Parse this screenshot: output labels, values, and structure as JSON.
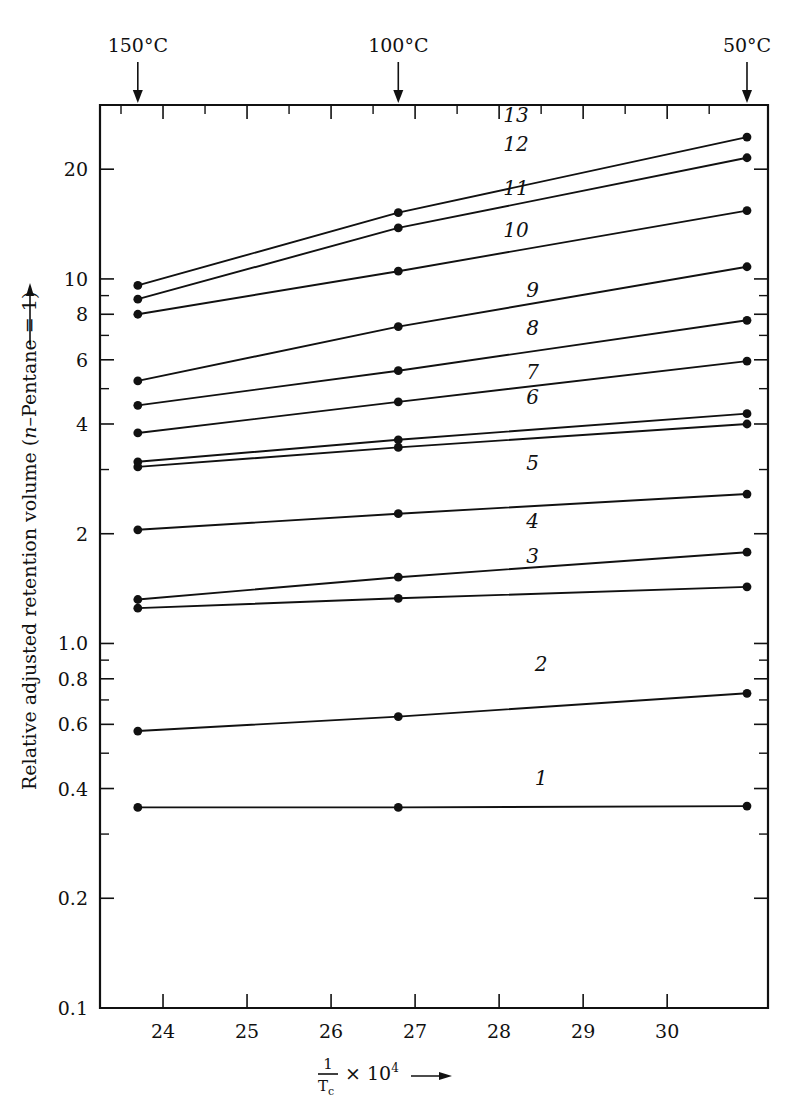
{
  "chart_data": {
    "type": "line",
    "title": "",
    "xlabel": "1/Tc × 10⁴ ⟶",
    "ylabel": "Relative adjusted retention volume (n-Pentane = 1) ⟶",
    "xscale": "linear",
    "yscale": "log",
    "xlim": [
      23.25,
      31.2
    ],
    "ylim": [
      0.1,
      30.0
    ],
    "grid": false,
    "legend_position": "inline-right",
    "x_tick_labels": [
      "24",
      "25",
      "26",
      "27",
      "28",
      "29",
      "30"
    ],
    "x_ticks": [
      24,
      25,
      26,
      27,
      28,
      29,
      30
    ],
    "y_tick_labels": [
      "20",
      "10",
      "8",
      "6",
      "4",
      "2",
      "1.0",
      "0.8",
      "0.6",
      "0.4",
      "0.2",
      "0.1"
    ],
    "y_ticks": [
      20,
      10,
      8,
      6,
      4,
      2,
      1.0,
      0.8,
      0.6,
      0.4,
      0.2,
      0.1
    ],
    "y_minor_ticks": [
      30,
      9,
      7,
      5,
      3,
      0.9,
      0.7,
      0.5,
      0.3
    ],
    "x_minor_ticks": [
      23.5,
      24.5,
      25.5,
      26.5,
      27.5,
      28.5,
      29.5,
      30.5
    ],
    "top_axis_annotations": [
      {
        "label": "150°C",
        "x": 23.7
      },
      {
        "label": "100°C",
        "x": 26.8
      },
      {
        "label": "50°C",
        "x": 30.95
      }
    ],
    "x": [
      23.7,
      26.8,
      30.95
    ],
    "series": [
      {
        "name": "1",
        "label": "1",
        "values": [
          0.355,
          0.355,
          0.358
        ],
        "label_x": 28.5,
        "label_y": 0.41
      },
      {
        "name": "2",
        "label": "2",
        "values": [
          0.575,
          0.63,
          0.73
        ],
        "label_x": 28.5,
        "label_y": 0.84
      },
      {
        "name": "3",
        "label": "3",
        "values": [
          1.25,
          1.33,
          1.43
        ],
        "label_x": 28.4,
        "label_y": 1.66
      },
      {
        "name": "4",
        "label": "4",
        "values": [
          1.32,
          1.52,
          1.78
        ],
        "label_x": 28.4,
        "label_y": 2.08
      },
      {
        "name": "5",
        "label": "5",
        "values": [
          2.05,
          2.27,
          2.57
        ],
        "label_x": 28.4,
        "label_y": 3.0
      },
      {
        "name": "6",
        "label": "6",
        "values": [
          3.05,
          3.45,
          4.0
        ],
        "label_x": 28.4,
        "label_y": 4.55
      },
      {
        "name": "7",
        "label": "7",
        "values": [
          3.15,
          3.62,
          4.27
        ],
        "label_x": 28.4,
        "label_y": 5.3
      },
      {
        "name": "8",
        "label": "8",
        "values": [
          3.78,
          4.6,
          5.95
        ],
        "label_x": 28.4,
        "label_y": 7.0
      },
      {
        "name": "9",
        "label": "9",
        "values": [
          4.5,
          5.6,
          7.7
        ],
        "label_x": 28.4,
        "label_y": 8.9
      },
      {
        "name": "10",
        "label": "10",
        "values": [
          5.25,
          7.4,
          10.8
        ],
        "label_x": 28.2,
        "label_y": 13.0
      },
      {
        "name": "11",
        "label": "11",
        "values": [
          8.0,
          10.5,
          15.4
        ],
        "label_x": 28.2,
        "label_y": 17.0
      },
      {
        "name": "12",
        "label": "12",
        "values": [
          8.8,
          13.8,
          21.5
        ],
        "label_x": 28.2,
        "label_y": 22.5
      },
      {
        "name": "13",
        "label": "13",
        "values": [
          9.6,
          15.2,
          24.5
        ],
        "label_x": 28.2,
        "label_y": 27.0
      }
    ]
  },
  "axis": {
    "y_title": "Relative adjusted retention volume (n-Pentane = 1)",
    "y_title_arrow": "⟶",
    "x_title_numerator": "1",
    "x_title_denominator": "T",
    "x_title_denominator_sub": "c",
    "x_title_rest": "× 10",
    "x_title_exp": "4",
    "x_title_arrow": "⟶"
  }
}
